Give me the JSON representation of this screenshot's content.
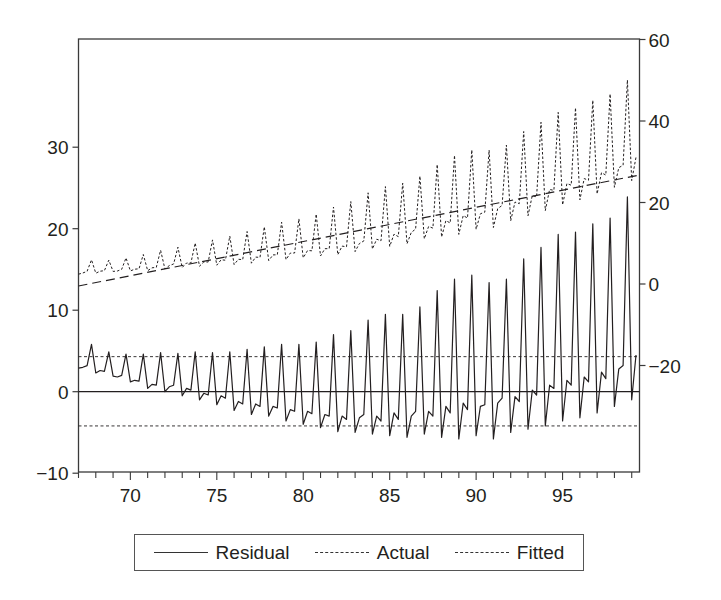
{
  "chart_data": {
    "type": "line",
    "title": "",
    "xlabel": "",
    "ylabel_left": "Residual",
    "ylabel_right": "Actual / Fitted",
    "frequency": "quarterly",
    "x_start": 1967.0,
    "x_step": 0.25,
    "xlim": [
      1967.0,
      1999.45
    ],
    "x_ticks": [
      {
        "value": 1970,
        "label": "70"
      },
      {
        "value": 1975,
        "label": "75"
      },
      {
        "value": 1980,
        "label": "80"
      },
      {
        "value": 1985,
        "label": "85"
      },
      {
        "value": 1990,
        "label": "90"
      },
      {
        "value": 1995,
        "label": "95"
      }
    ],
    "y_left": {
      "lim": [
        -10,
        39
      ],
      "ticks": [
        {
          "value": -10,
          "label": "−10"
        },
        {
          "value": 0,
          "label": "0"
        },
        {
          "value": 10,
          "label": "10"
        },
        {
          "value": 20,
          "label": "20"
        },
        {
          "value": 30,
          "label": "30"
        }
      ]
    },
    "y_right": {
      "lim": [
        -46,
        60
      ],
      "ticks": [
        {
          "value": -20,
          "label": "−20"
        },
        {
          "value": 0,
          "label": "0"
        },
        {
          "value": 20,
          "label": "20"
        },
        {
          "value": 40,
          "label": "40"
        },
        {
          "value": 60,
          "label": "60"
        }
      ]
    },
    "reference_lines": [
      {
        "axis": "left",
        "value": 0,
        "style": "solid",
        "label": "zero"
      },
      {
        "axis": "left",
        "value": 4.3,
        "style": "dotted",
        "label": "+1 S.E."
      },
      {
        "axis": "left",
        "value": -4.2,
        "style": "dotted",
        "label": "-1 S.E."
      }
    ],
    "grid": false,
    "legend_position": "bottom",
    "series": [
      {
        "name": "Residual",
        "axis": "left",
        "style": "solid",
        "values": [
          2.9,
          3.0,
          3.2,
          5.8,
          2.3,
          2.6,
          2.5,
          4.9,
          1.9,
          1.8,
          2.0,
          4.6,
          1.2,
          1.4,
          1.3,
          4.6,
          0.4,
          0.9,
          0.8,
          4.8,
          0.0,
          0.6,
          0.8,
          4.7,
          -0.5,
          0.4,
          0.2,
          4.9,
          -1.0,
          -0.2,
          -0.4,
          4.8,
          -1.6,
          -0.5,
          -0.8,
          4.9,
          -2.3,
          -1.2,
          -1.5,
          5.2,
          -2.8,
          -1.5,
          -1.8,
          5.5,
          -3.0,
          -1.8,
          -2.0,
          5.8,
          -3.6,
          -2.2,
          -2.4,
          5.8,
          -4.0,
          -2.4,
          -2.7,
          6.1,
          -4.4,
          -2.8,
          -3.0,
          7.0,
          -4.9,
          -3.0,
          -3.4,
          7.5,
          -5.0,
          -3.2,
          -2.8,
          8.8,
          -5.2,
          -3.0,
          -3.6,
          9.5,
          -5.4,
          -2.6,
          -3.4,
          9.5,
          -5.6,
          -3.0,
          -2.4,
          10.4,
          -5.2,
          -2.4,
          -3.0,
          12.4,
          -5.6,
          -1.8,
          -2.6,
          13.8,
          -5.8,
          -1.4,
          -2.2,
          14.3,
          -5.4,
          -1.8,
          -1.6,
          13.4,
          -5.8,
          -1.4,
          -0.8,
          13.8,
          -5.0,
          -0.6,
          -1.2,
          16.3,
          -4.6,
          0.2,
          -0.4,
          17.7,
          -4.2,
          0.8,
          0.4,
          19.3,
          -3.6,
          1.4,
          0.8,
          19.6,
          -3.2,
          1.8,
          1.2,
          20.6,
          -2.6,
          2.4,
          1.6,
          21.3,
          -1.8,
          2.8,
          3.2,
          23.9,
          -1.0,
          4.5
        ]
      },
      {
        "name": "Actual",
        "axis": "right",
        "style": "dotted",
        "values": [
          2.4,
          2.71,
          3.12,
          5.93,
          2.64,
          3.15,
          3.26,
          5.87,
          3.08,
          3.19,
          3.6,
          6.41,
          3.22,
          3.63,
          3.74,
          7.25,
          3.26,
          3.97,
          4.08,
          8.29,
          3.7,
          4.51,
          4.92,
          9.03,
          4.04,
          5.15,
          5.16,
          10.07,
          4.38,
          5.39,
          5.4,
          10.81,
          4.62,
          5.93,
          5.84,
          11.75,
          4.76,
          6.07,
          5.98,
          12.89,
          5.1,
          6.61,
          6.52,
          14.03,
          5.74,
          7.15,
          7.16,
          15.17,
          5.98,
          7.59,
          7.6,
          16.01,
          6.42,
          8.23,
          8.14,
          17.15,
          6.86,
          8.67,
          8.68,
          18.89,
          7.2,
          9.31,
          9.12,
          20.23,
          7.94,
          9.95,
          10.56,
          22.37,
          8.58,
          10.99,
          10.6,
          23.91,
          9.22,
          12.23,
          11.64,
          24.75,
          9.86,
          12.67,
          13.48,
          26.49,
          11.1,
          14.11,
          13.72,
          29.33,
          11.54,
          15.55,
          14.96,
          31.57,
          12.18,
          16.79,
          16.2,
          32.91,
          13.42,
          17.23,
          17.64,
          32.85,
          13.86,
          18.47,
          19.28,
          34.09,
          15.5,
          20.11,
          19.72,
          37.43,
          16.74,
          21.75,
          21.36,
          39.67,
          17.98,
          23.19,
          23.0,
          42.11,
          19.42,
          24.63,
          24.24,
          43.25,
          20.66,
          25.87,
          25.48,
          45.09,
          22.1,
          27.31,
          26.72,
          46.63,
          23.74,
          28.55,
          29.16,
          50.07,
          25.38,
          31.09
        ]
      },
      {
        "name": "Fitted",
        "axis": "right",
        "style": "dashed",
        "trend": {
          "start": -0.5,
          "step_per_quarter": 0.21
        },
        "values": [
          -0.5,
          -0.29,
          -0.08,
          0.13,
          0.34,
          0.55,
          0.76,
          0.97,
          1.18,
          1.39,
          1.6,
          1.81,
          2.02,
          2.23,
          2.44,
          2.65,
          2.86,
          3.07,
          3.28,
          3.49,
          3.7,
          3.91,
          4.12,
          4.33,
          4.54,
          4.75,
          4.96,
          5.17,
          5.38,
          5.59,
          5.8,
          6.01,
          6.22,
          6.43,
          6.64,
          6.85,
          7.06,
          7.27,
          7.48,
          7.69,
          7.9,
          8.11,
          8.32,
          8.53,
          8.74,
          8.95,
          9.16,
          9.37,
          9.58,
          9.79,
          10.0,
          10.21,
          10.42,
          10.63,
          10.84,
          11.05,
          11.26,
          11.47,
          11.68,
          11.89,
          12.1,
          12.31,
          12.52,
          12.73,
          12.94,
          13.15,
          13.36,
          13.57,
          13.78,
          13.99,
          14.2,
          14.41,
          14.62,
          14.83,
          15.04,
          15.25,
          15.46,
          15.67,
          15.88,
          16.09,
          16.3,
          16.51,
          16.72,
          16.93,
          17.14,
          17.35,
          17.56,
          17.77,
          17.98,
          18.19,
          18.4,
          18.61,
          18.82,
          19.03,
          19.24,
          19.45,
          19.66,
          19.87,
          20.08,
          20.29,
          20.5,
          20.71,
          20.92,
          21.13,
          21.34,
          21.55,
          21.76,
          21.97,
          22.18,
          22.39,
          22.6,
          22.81,
          23.02,
          23.23,
          23.44,
          23.65,
          23.86,
          24.07,
          24.28,
          24.49,
          24.7,
          24.91,
          25.12,
          25.33,
          25.54,
          25.75,
          25.96,
          26.17,
          26.38,
          26.59
        ]
      }
    ]
  },
  "legend": {
    "items": [
      {
        "label": "Residual",
        "style": "solid"
      },
      {
        "label": "Actual",
        "style": "dotted"
      },
      {
        "label": "Fitted",
        "style": "dashed"
      }
    ]
  },
  "colors": {
    "line": "#231f20",
    "frame": "#3a3a3a",
    "background": "#ffffff"
  }
}
